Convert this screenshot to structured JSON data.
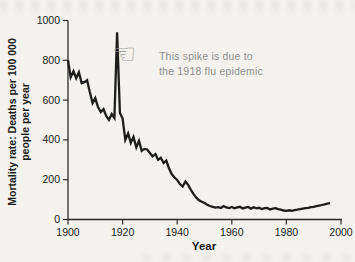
{
  "figure": {
    "xlabel": "Year",
    "ylabel_line1": "Mortality rate: Deaths per 100 000",
    "ylabel_line2": "people per year",
    "annotation": {
      "icon": "pointing-hand-left",
      "hand_glyph": "☜",
      "line1": "This spike is due to",
      "line2": "the 1918 flu epidemic"
    },
    "colors": {
      "background": "#f3f2ee",
      "data_line": "#1d1d1d",
      "axis": "#2b2b2b",
      "tick_text": "#1b1b1b",
      "annotation_text": "#8f8f8f"
    }
  },
  "chart_data": {
    "type": "line",
    "title": "",
    "xlabel": "Year",
    "ylabel": "Mortality rate: Deaths per 100 000 people per year",
    "xlim": [
      1900,
      2000
    ],
    "ylim": [
      0,
      1000
    ],
    "x_ticks": [
      1900,
      1920,
      1940,
      1960,
      1980,
      2000
    ],
    "y_ticks": [
      0,
      200,
      400,
      600,
      800,
      1000
    ],
    "grid": false,
    "legend": false,
    "annotations": [
      {
        "text": "This spike is due to the 1918 flu epidemic",
        "points_to_x": 1918,
        "points_to_y": 940
      }
    ],
    "series": [
      {
        "name": "Infectious disease mortality rate",
        "x_start": 1900,
        "x_step": 1,
        "values": [
          800,
          715,
          745,
          710,
          740,
          685,
          690,
          700,
          640,
          585,
          610,
          565,
          540,
          555,
          520,
          500,
          530,
          510,
          940,
          535,
          508,
          400,
          432,
          385,
          415,
          362,
          395,
          345,
          355,
          352,
          334,
          317,
          329,
          300,
          310,
          284,
          296,
          258,
          228,
          211,
          199,
          178,
          166,
          191,
          174,
          149,
          127,
          110,
          97,
          89,
          83,
          74,
          68,
          64,
          60,
          62,
          58,
          68,
          61,
          58,
          63,
          57,
          61,
          64,
          56,
          60,
          63,
          55,
          62,
          56,
          59,
          53,
          57,
          58,
          51,
          55,
          57,
          52,
          49,
          45,
          43,
          46,
          43,
          47,
          49,
          52,
          55,
          57,
          59,
          62,
          64,
          67,
          70,
          73,
          76,
          80,
          82
        ]
      }
    ]
  }
}
